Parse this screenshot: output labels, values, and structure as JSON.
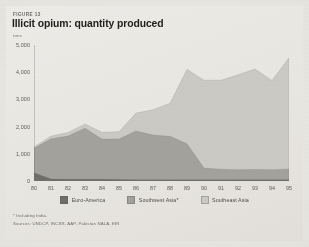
{
  "figure": {
    "kicker": "FIGURE 13",
    "title": "Illicit opium: quantity produced",
    "unit": "tons",
    "footnote": "* Including India.",
    "source": "Sources: UNDCP, INCSR, AAP, Pakistan NALA, EIR"
  },
  "legend": {
    "position": "bottom-center",
    "items": [
      {
        "label": "Euro-America",
        "color": "#6f6e6a"
      },
      {
        "label": "Southwest Asia*",
        "color": "#a3a29d"
      },
      {
        "label": "Southeast Asia",
        "color": "#cbcac5"
      }
    ]
  },
  "chart_data": {
    "type": "area",
    "stacked": true,
    "title": "Illicit opium: quantity produced",
    "subtitle": "FIGURE 13",
    "xlabel": "",
    "ylabel": "tons",
    "ylim": [
      0,
      5000
    ],
    "yticks": [
      0,
      1000,
      2000,
      3000,
      4000,
      5000
    ],
    "ytick_labels": [
      "0",
      "1,000",
      "2,000",
      "3,000",
      "4,000",
      "5,000"
    ],
    "grid": false,
    "x": [
      1980,
      1981,
      1982,
      1983,
      1984,
      1985,
      1986,
      1987,
      1988,
      1989,
      1990,
      1991,
      1992,
      1993,
      1994,
      1995
    ],
    "xtick_labels": [
      "80",
      "81",
      "82",
      "83",
      "84",
      "85",
      "86",
      "87",
      "88",
      "89",
      "90",
      "91",
      "92",
      "93",
      "94",
      "95"
    ],
    "series": [
      {
        "name": "Euro-America",
        "color": "#6f6e6a",
        "values": [
          300,
          70,
          60,
          60,
          60,
          55,
          50,
          50,
          45,
          45,
          45,
          45,
          45,
          45,
          45,
          45
        ]
      },
      {
        "name": "Southwest Asia*",
        "color": "#a3a29d",
        "values": [
          900,
          1480,
          1590,
          1880,
          1480,
          1490,
          1790,
          1640,
          1600,
          1320,
          430,
          390,
          370,
          380,
          370,
          390
        ]
      },
      {
        "name": "Southeast Asia",
        "color": "#cbcac5",
        "values": [
          50,
          100,
          130,
          160,
          250,
          270,
          660,
          930,
          1210,
          2740,
          3230,
          3270,
          3490,
          3690,
          3280,
          4100
        ]
      }
    ],
    "totals": [
      1250,
      1650,
      1780,
      2100,
      1790,
      1815,
      2500,
      2620,
      2855,
      4105,
      3705,
      3705,
      3905,
      4115,
      3695,
      4535
    ]
  }
}
